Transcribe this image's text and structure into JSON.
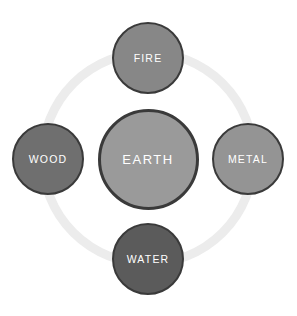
{
  "canvas": {
    "width": 297,
    "height": 316,
    "background_color": "#ffffff"
  },
  "diagram": {
    "type": "five-elements-cycle",
    "ring": {
      "name": "connector-ring",
      "color": "#ececec",
      "center_x": 148,
      "center_y": 158,
      "radius": 110,
      "thickness": 9
    },
    "border_color": "#3b3b3b",
    "label_color": "#ffffff",
    "nodes": [
      {
        "id": "fire",
        "label": "FIRE",
        "position": "top",
        "center_x": 148,
        "center_y": 58,
        "diameter": 72,
        "fill_color": "#878787",
        "border_color": "#3a3a3a",
        "border_width": 2
      },
      {
        "id": "wood",
        "label": "WOOD",
        "position": "left",
        "center_x": 48,
        "center_y": 159,
        "diameter": 72,
        "fill_color": "#6f6f6f",
        "border_color": "#3a3a3a",
        "border_width": 2
      },
      {
        "id": "earth",
        "label": "EARTH",
        "position": "center",
        "center_x": 148,
        "center_y": 159,
        "diameter": 101,
        "fill_color": "#9a9a9a",
        "border_color": "#3a3a3a",
        "border_width": 3
      },
      {
        "id": "metal",
        "label": "METAL",
        "position": "right",
        "center_x": 248,
        "center_y": 159,
        "diameter": 72,
        "fill_color": "#949494",
        "border_color": "#3a3a3a",
        "border_width": 2
      },
      {
        "id": "water",
        "label": "WATER",
        "position": "bottom",
        "center_x": 148,
        "center_y": 259,
        "diameter": 72,
        "fill_color": "#5b5b5b",
        "border_color": "#3a3a3a",
        "border_width": 2
      }
    ]
  }
}
